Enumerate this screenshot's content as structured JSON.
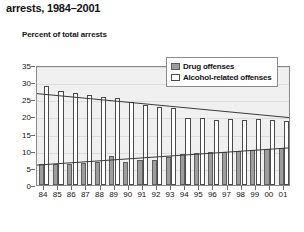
{
  "title": "arrests, 1984–2001",
  "axis_label": "Percent of total arrests",
  "legend": {
    "drug_label": "Drug offenses",
    "alcohol_label": "Alcohol-related offenses"
  },
  "colors": {
    "drug_fill": "#9d9d9d",
    "drug_edge": "#5e5e5e",
    "alcohol_fill": "#ffffff",
    "alcohol_edge": "#4a4a4a",
    "plot_background": "#f0f0f0",
    "trendline": "#3a3a3a"
  },
  "chart_data": {
    "type": "bar",
    "title": "arrests, 1984–2001",
    "subtitle": "",
    "xlabel": "",
    "ylabel": "Percent of total arrests",
    "ylim": [
      0,
      35
    ],
    "yticks": [
      0,
      5,
      10,
      15,
      20,
      25,
      30,
      35
    ],
    "ytick_labels": [
      "0",
      "5",
      "10",
      "15",
      "20",
      "25",
      "30",
      "35"
    ],
    "grid": true,
    "legend_position": "top-right",
    "categories": [
      "84",
      "85",
      "86",
      "87",
      "88",
      "89",
      "90",
      "91",
      "92",
      "93",
      "94",
      "95",
      "96",
      "97",
      "98",
      "99",
      "00",
      "01"
    ],
    "series": [
      {
        "name": "Drug offenses",
        "values": [
          6.0,
          6.0,
          6.2,
          6.3,
          6.6,
          8.4,
          6.7,
          7.2,
          7.4,
          8.2,
          9.0,
          9.4,
          9.6,
          9.7,
          9.9,
          10.2,
          10.4,
          10.8
        ]
      },
      {
        "name": "Alcohol-related offenses",
        "values": [
          28.8,
          27.4,
          26.9,
          26.4,
          25.8,
          25.3,
          24.3,
          23.2,
          22.8,
          22.4,
          19.6,
          19.5,
          19.0,
          19.2,
          19.0,
          19.3,
          19.1,
          18.8
        ]
      }
    ],
    "trendlines": [
      {
        "name": "Alcohol-related offenses trend",
        "start": 27.1,
        "end": 20.0
      },
      {
        "name": "Drug offenses trend",
        "start": 5.9,
        "end": 11.0
      }
    ]
  }
}
